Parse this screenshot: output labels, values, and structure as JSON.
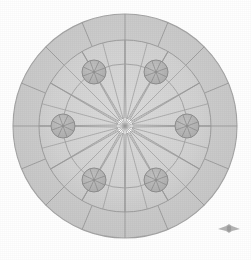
{
  "figure": {
    "title": "Radial rose-window geometric diagram",
    "background_color": "#ffffff",
    "canvas": {
      "width": 251,
      "height": 260
    },
    "center": {
      "x": 125,
      "y": 126
    },
    "outer_circle": {
      "name": "outer-rim-circle",
      "radius": 112,
      "stroke_color": "#a8a8a8",
      "fill_color": "#d2d2d2"
    },
    "ring_band": {
      "name": "outer-ring-band",
      "inner_radius": 86,
      "outer_radius": 112,
      "fill_color": "#cfcfcf",
      "stroke_color": "#a4a4a4",
      "spoke_count": 16,
      "spoke_stroke": "#9a9a9a"
    },
    "inner_circle": {
      "name": "inner-field-circle",
      "radius": 86,
      "fill_color": "#d6d6d6",
      "stroke_color": "#9e9e9e"
    },
    "node_ring": {
      "name": "node-orbit-circle",
      "radius": 62,
      "stroke_color": "#a0a0a0"
    },
    "star": {
      "name": "twelve-point-star",
      "points": 12,
      "outer_radius": 86,
      "inner_radius": 6,
      "fill_color": "#ffffff",
      "stroke_color": "#9b9b9b",
      "rotation_deg": -90,
      "tip_half_angle_deg": 7
    },
    "radial_spokes": {
      "name": "center-radial-lines",
      "count": 24,
      "stroke_color": "#9c9c9c",
      "length": 86
    },
    "nodes": [
      {
        "label": "node-1",
        "angle_deg": -60,
        "cx": 156,
        "cy": 72,
        "r": 12
      },
      {
        "label": "node-2",
        "angle_deg": 0,
        "cx": 187,
        "cy": 126,
        "r": 12
      },
      {
        "label": "node-3",
        "angle_deg": 60,
        "cx": 156,
        "cy": 180,
        "r": 12
      },
      {
        "label": "node-4",
        "angle_deg": 120,
        "cx": 94,
        "cy": 180,
        "r": 12
      },
      {
        "label": "node-5",
        "angle_deg": 180,
        "cx": 63,
        "cy": 126,
        "r": 12
      },
      {
        "label": "node-6",
        "angle_deg": -120,
        "cx": 94,
        "cy": 72,
        "r": 12
      }
    ],
    "node_style": {
      "fill_color": "#b4b4b4",
      "stroke_color": "#8e8e8e",
      "spoke_count": 4,
      "spoke_stroke": "#8a8a8a"
    },
    "watermark": {
      "name": "winged-emblem-watermark",
      "x": 218,
      "y": 224,
      "width": 22,
      "height": 10,
      "color": "#b9b9b9",
      "icon": "winged-emblem-icon",
      "alt_text": "winged emblem"
    }
  }
}
